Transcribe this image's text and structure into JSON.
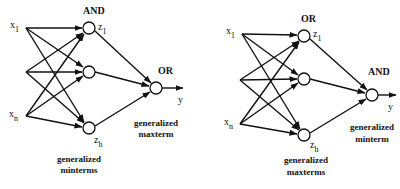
{
  "diagrams": [
    {
      "id": "left",
      "hidden_layer_label": "AND",
      "output_label": "OR",
      "inputs": [
        {
          "name": "x",
          "sub": "1"
        },
        {
          "name": "x",
          "sub": "n"
        }
      ],
      "hidden_nodes": [
        {
          "name": "z",
          "sub": "1"
        },
        {
          "name": "z",
          "sub": "h"
        }
      ],
      "output": "y",
      "output_caption": [
        "generalized",
        "maxterm"
      ],
      "hidden_caption": [
        "generalized",
        "minterms"
      ]
    },
    {
      "id": "right",
      "hidden_layer_label": "OR",
      "output_label": "AND",
      "inputs": [
        {
          "name": "x",
          "sub": "1"
        },
        {
          "name": "x",
          "sub": "n"
        }
      ],
      "hidden_nodes": [
        {
          "name": "z",
          "sub": "1"
        },
        {
          "name": "z",
          "sub": "h"
        }
      ],
      "output": "y",
      "output_caption": [
        "generalized",
        "minterm"
      ],
      "hidden_caption": [
        "generalized",
        "maxterms"
      ]
    }
  ],
  "colors": {
    "ink": "#111111",
    "background": "#ffffff"
  }
}
